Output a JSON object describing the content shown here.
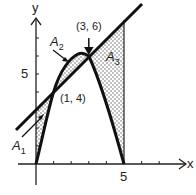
{
  "figure": {
    "axes": {
      "x_label": "x",
      "y_label": "y",
      "x_tick_label": "5",
      "y_tick_label": "5"
    },
    "points": [
      {
        "label": "(1, 4)",
        "x": 1,
        "y": 4
      },
      {
        "label": "(3, 6)",
        "x": 3,
        "y": 6
      }
    ],
    "regions": [
      {
        "name": "A",
        "sub": "1"
      },
      {
        "name": "A",
        "sub": "2"
      },
      {
        "name": "A",
        "sub": "3"
      }
    ],
    "curves": {
      "line": "y = x + 3",
      "parabola": "y = 5x - x^2"
    },
    "vertical_line_x": 5
  }
}
